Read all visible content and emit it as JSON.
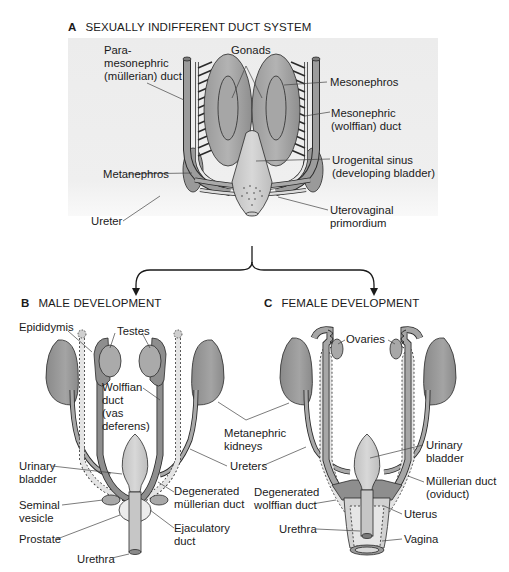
{
  "figure": {
    "panel_a": {
      "letter": "A",
      "title": "SEXUALLY INDIFFERENT DUCT SYSTEM",
      "labels": {
        "paramesonephric": [
          "Para-",
          "mesonephric",
          "(müllerian) duct"
        ],
        "gonads": "Gonads",
        "mesonephros": "Mesonephros",
        "mesonephric_duct": [
          "Mesonephric",
          "(wolffian) duct"
        ],
        "metanephros": "Metanephros",
        "urogenital_sinus": [
          "Urogenital sinus",
          "(developing bladder)"
        ],
        "ureter": "Ureter",
        "uterovaginal": [
          "Uterovaginal",
          "primordium"
        ]
      }
    },
    "panel_b": {
      "letter": "B",
      "title": "MALE DEVELOPMENT",
      "labels": {
        "epididymis": "Epididymis",
        "testes": "Testes",
        "wolffian_duct": [
          "Wolffian",
          "duct",
          "(vas",
          "deferens)"
        ],
        "urinary_bladder": [
          "Urinary",
          "bladder"
        ],
        "seminal_vesicle": [
          "Seminal",
          "vesicle"
        ],
        "prostate": "Prostate",
        "urethra": "Urethra",
        "degenerated_mullerian": [
          "Degenerated",
          "müllerian duct"
        ],
        "ejaculatory_duct": [
          "Ejaculatory",
          "duct"
        ]
      }
    },
    "shared_labels": {
      "metanephric_kidneys": [
        "Metanephric",
        "kidneys"
      ],
      "ureters": "Ureters"
    },
    "panel_c": {
      "letter": "C",
      "title": "FEMALE DEVELOPMENT",
      "labels": {
        "ovaries": "Ovaries",
        "urinary_bladder": [
          "Urinary",
          "bladder"
        ],
        "mullerian_duct": [
          "Müllerian duct",
          "(oviduct)"
        ],
        "degenerated_wolffian": [
          "Degenerated",
          "wolffian duct"
        ],
        "uterus": "Uterus",
        "urethra": "Urethra",
        "vagina": "Vagina"
      }
    },
    "colors": {
      "panel_bg": "#ececec",
      "organ_dark": "#8c8c8c",
      "organ_mid": "#a8a8a8",
      "organ_light": "#c4c4c4",
      "duct_pale": "#e2e2e2",
      "outline": "#2a2a2a",
      "leader": "#444444"
    }
  }
}
